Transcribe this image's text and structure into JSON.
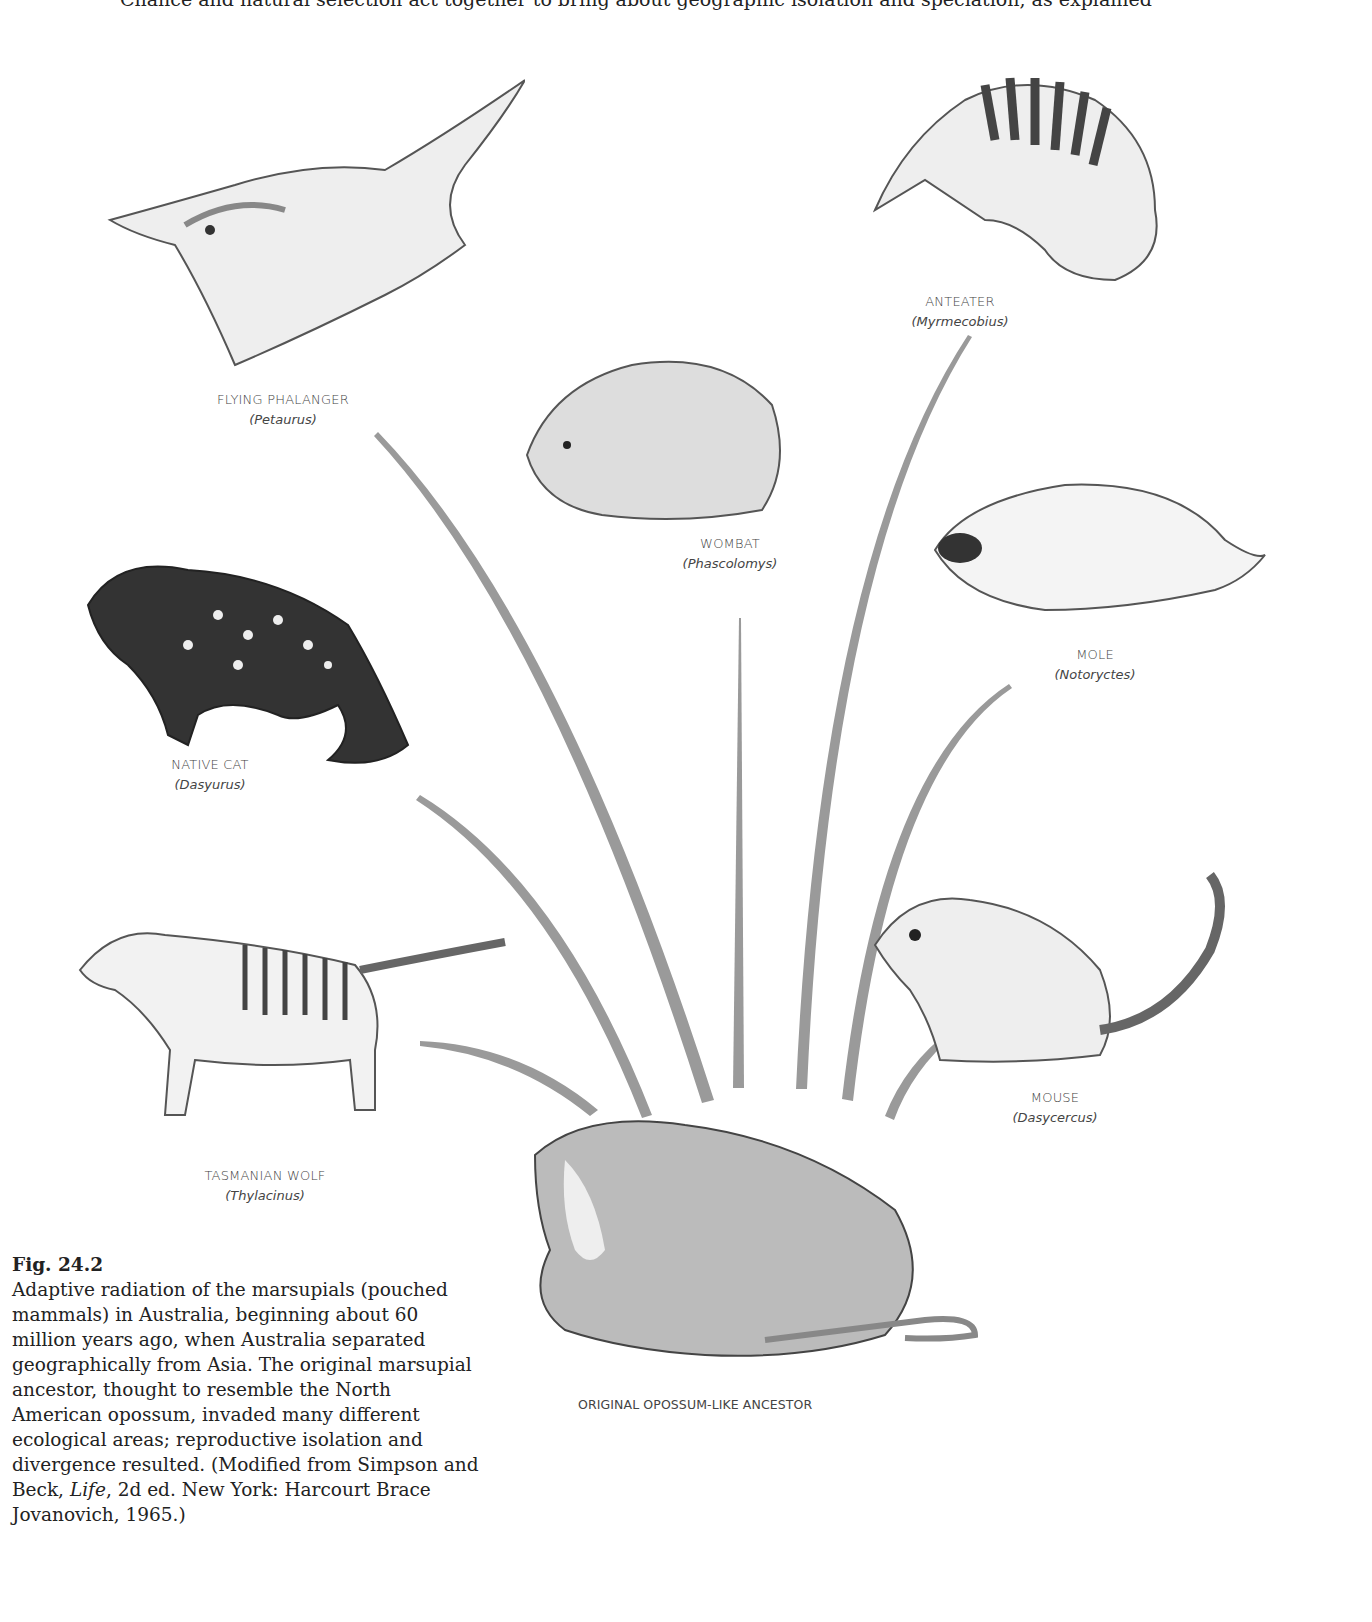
{
  "top_line": "Chance and natural selection act together to bring about geographic isolation and speciation, as explained",
  "figure": {
    "number": "Fig. 24.2",
    "caption_parts": {
      "before_italic": "Adaptive radiation of the marsupials (pouched mammals) in Australia, beginning about 60 million years ago, when Australia separated geographically from Asia. The original marsupial ancestor, thought to resemble the North American opossum, invaded many different ecological areas; reproductive isolation and divergence resulted. (Modified from Simpson and Beck, ",
      "italic": "Life",
      "after_italic": ", 2d ed. New York: Harcourt Brace Jovanovich, 1965.)"
    }
  },
  "ancestor": {
    "label": "ORIGINAL OPOSSUM-LIKE ANCESTOR"
  },
  "animals": {
    "flying_phalanger": {
      "common": "FLYING PHALANGER",
      "scientific": "(Petaurus)"
    },
    "anteater": {
      "common": "ANTEATER",
      "scientific": "(Myrmecobius)"
    },
    "wombat": {
      "common": "WOMBAT",
      "scientific": "(Phascolomys)"
    },
    "mole": {
      "common": "MOLE",
      "scientific": "(Notoryctes)"
    },
    "native_cat": {
      "common": "NATIVE CAT",
      "scientific": "(Dasyurus)"
    },
    "mouse": {
      "common": "MOUSE",
      "scientific": "(Dasycercus)"
    },
    "tasmanian_wolf": {
      "common": "TASMANIAN WOLF",
      "scientific": "(Thylacinus)"
    }
  },
  "colors": {
    "radiation_lines": "#9a9a9a",
    "sketch": "#555555"
  }
}
